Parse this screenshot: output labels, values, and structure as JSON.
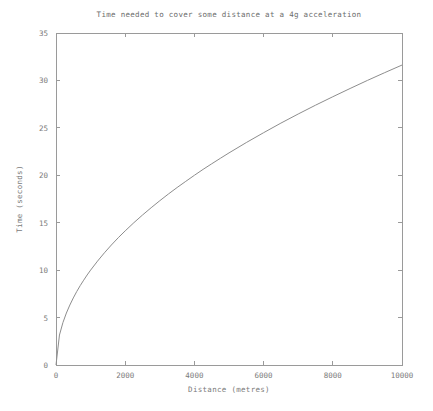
{
  "chart_data": {
    "type": "line",
    "title": "Time needed to cover some distance at a 4g acceleration",
    "xlabel": "Distance (metres)",
    "ylabel": "Time (seconds)",
    "xlim": [
      0,
      10000
    ],
    "ylim": [
      0,
      35
    ],
    "xticks": [
      0,
      2000,
      4000,
      6000,
      8000,
      10000
    ],
    "xtick_labels": [
      "0",
      "2000",
      "4000",
      "6000",
      "8000",
      "10000"
    ],
    "yticks": [
      0,
      5,
      10,
      15,
      20,
      25,
      30,
      35
    ],
    "ytick_labels": [
      "0",
      "5",
      "10",
      "15",
      "20",
      "25",
      "30",
      "35"
    ],
    "grid": false,
    "legend": false,
    "legend_position": "none",
    "series": [
      {
        "name": "time",
        "relation": "t = sqrt(2*d/a), a = 20 m/s^2",
        "x": [
          0,
          100,
          200,
          300,
          400,
          500,
          600,
          700,
          800,
          900,
          1000,
          1200,
          1400,
          1600,
          1800,
          2000,
          2250,
          2500,
          2750,
          3000,
          3250,
          3500,
          3750,
          4000,
          4250,
          4500,
          4750,
          5000,
          5500,
          6000,
          6500,
          7000,
          7500,
          8000,
          8500,
          9000,
          9500,
          10000
        ],
        "values": [
          0.0,
          3.16,
          4.47,
          5.48,
          6.32,
          7.07,
          7.75,
          8.37,
          8.94,
          9.49,
          10.0,
          10.95,
          11.83,
          12.65,
          13.42,
          14.14,
          15.0,
          15.81,
          16.58,
          17.32,
          18.03,
          18.71,
          19.36,
          20.0,
          20.62,
          21.21,
          21.79,
          22.36,
          23.45,
          24.49,
          25.5,
          26.46,
          27.39,
          28.28,
          29.15,
          30.0,
          30.82,
          31.62
        ]
      }
    ],
    "colors": {
      "curve": "#8d8d8d",
      "axis": "#9a9a9a",
      "text": "#7a7a7a",
      "background": "#ffffff"
    }
  },
  "plot_geometry": {
    "left": 56,
    "right": 402,
    "top": 33,
    "bottom": 365
  }
}
